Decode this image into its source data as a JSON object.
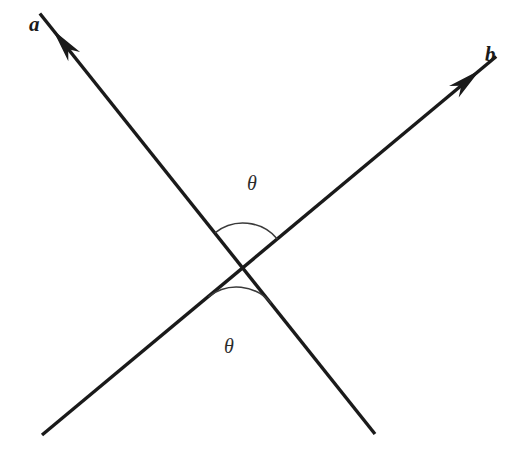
{
  "figure": {
    "background_color": "#ffffff",
    "line_color": "#1a1a1a",
    "arc_color": "#3a3a3a",
    "width": 528,
    "height": 453
  },
  "labels": {
    "vector_a": "a",
    "vector_b": "b",
    "angle_top": "θ",
    "angle_bottom": "θ"
  },
  "chart_data": {
    "type": "diagram",
    "intersection": {
      "x": 243,
      "y": 268
    },
    "vectors": [
      {
        "name": "a",
        "label": "a",
        "tail": {
          "x": 375,
          "y": 434
        },
        "tip": {
          "x": 53,
          "y": 30
        },
        "arrowhead_at": "tip",
        "label_position": {
          "x": 38,
          "y": 24
        }
      },
      {
        "name": "b",
        "label": "b",
        "tail": {
          "x": 42,
          "y": 435
        },
        "tip": {
          "x": 480,
          "y": 70
        },
        "arrowhead_at": "tip",
        "label_position": {
          "x": 494,
          "y": 54
        }
      }
    ],
    "angle_arcs": [
      {
        "name": "theta-top",
        "label": "θ",
        "center": {
          "x": 243,
          "y": 268
        },
        "radius": 45,
        "between": [
          "a",
          "b"
        ],
        "side": "upper",
        "label_position": {
          "x": 255,
          "y": 183
        }
      },
      {
        "name": "theta-bottom",
        "label": "θ",
        "center": {
          "x": 243,
          "y": 268
        },
        "radius": 45,
        "between": [
          "a",
          "b"
        ],
        "side": "lower",
        "label_position": {
          "x": 232,
          "y": 346
        }
      }
    ]
  }
}
